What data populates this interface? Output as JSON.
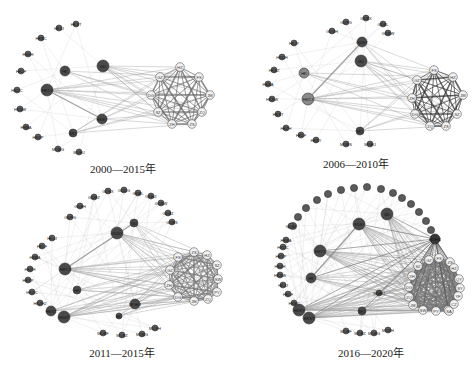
{
  "figure": {
    "panels": [
      {
        "id": "p1",
        "caption": "2000—2015年",
        "hub_left": [
          {
            "label": "HKTJ",
            "x": 47,
            "y": 90,
            "r": 6,
            "dark": true
          },
          {
            "label": "HK",
            "x": 65,
            "y": 71,
            "r": 5,
            "dark": true
          },
          {
            "label": "GD",
            "x": 103,
            "y": 66,
            "r": 6,
            "dark": true
          },
          {
            "label": "HKSY",
            "x": 102,
            "y": 119,
            "r": 5,
            "dark": true
          },
          {
            "label": "MO",
            "x": 73,
            "y": 133,
            "r": 4,
            "dark": true
          }
        ],
        "ring": [
          {
            "label": "HKST",
            "x": 76,
            "y": 24
          },
          {
            "label": "HKJJ",
            "x": 59,
            "y": 28
          },
          {
            "label": "HKBC",
            "x": 41,
            "y": 38
          },
          {
            "label": "HKZH",
            "x": 28,
            "y": 54
          },
          {
            "label": "HKLF",
            "x": 21,
            "y": 71
          },
          {
            "label": "HKDC",
            "x": 17,
            "y": 90
          },
          {
            "label": "HKSW",
            "x": 20,
            "y": 109
          },
          {
            "label": "HKBA",
            "x": 26,
            "y": 127
          },
          {
            "label": "HKYP",
            "x": 38,
            "y": 137
          },
          {
            "label": "MOBG",
            "x": 58,
            "y": 149
          },
          {
            "label": "MOHJ",
            "x": 79,
            "y": 152
          }
        ],
        "cluster": [
          {
            "label": "HZ",
            "x": 180,
            "y": 67
          },
          {
            "label": "FS",
            "x": 199,
            "y": 77
          },
          {
            "label": "JM",
            "x": 210,
            "y": 95
          },
          {
            "label": "ZQ",
            "x": 202,
            "y": 112
          },
          {
            "label": "ZS",
            "x": 192,
            "y": 124
          },
          {
            "label": "ZH",
            "x": 172,
            "y": 124
          },
          {
            "label": "SZ",
            "x": 158,
            "y": 112
          },
          {
            "label": "DG",
            "x": 151,
            "y": 95
          },
          {
            "label": "GZ",
            "x": 160,
            "y": 77
          }
        ]
      },
      {
        "id": "p2",
        "caption": "2006—2010年",
        "hub_left": [
          {
            "label": "HKTJ",
            "x": 70,
            "y": 99,
            "r": 6,
            "dark": false
          },
          {
            "label": "HK",
            "x": 66,
            "y": 73,
            "r": 5,
            "dark": false
          },
          {
            "label": "GD",
            "x": 123,
            "y": 61,
            "r": 6,
            "dark": true
          },
          {
            "label": "GDSY",
            "x": 124,
            "y": 42,
            "r": 5,
            "dark": true
          },
          {
            "label": "MO",
            "x": 122,
            "y": 131,
            "r": 4,
            "dark": true
          }
        ],
        "ring": [
          {
            "label": "GDSH",
            "x": 94,
            "y": 31
          },
          {
            "label": "GDFG",
            "x": 108,
            "y": 22
          },
          {
            "label": "GDSX",
            "x": 128,
            "y": 18
          },
          {
            "label": "GDBL",
            "x": 145,
            "y": 24
          },
          {
            "label": "GDSW",
            "x": 150,
            "y": 33
          },
          {
            "label": "HKJY",
            "x": 56,
            "y": 43
          },
          {
            "label": "HKDH",
            "x": 44,
            "y": 57
          },
          {
            "label": "HKSZ",
            "x": 36,
            "y": 70
          },
          {
            "label": "HKBA",
            "x": 30,
            "y": 84
          },
          {
            "label": "HKSW",
            "x": 34,
            "y": 99
          },
          {
            "label": "HKST",
            "x": 40,
            "y": 114
          },
          {
            "label": "HKZH",
            "x": 48,
            "y": 128
          },
          {
            "label": "HKLF",
            "x": 63,
            "y": 135
          },
          {
            "label": "HKSY",
            "x": 78,
            "y": 140
          },
          {
            "label": "MOBS",
            "x": 108,
            "y": 144
          },
          {
            "label": "MOHJ",
            "x": 132,
            "y": 144
          }
        ],
        "cluster": [
          {
            "label": "FS",
            "x": 196,
            "y": 70
          },
          {
            "label": "HZ",
            "x": 215,
            "y": 77
          },
          {
            "label": "JM",
            "x": 225,
            "y": 95
          },
          {
            "label": "SZ",
            "x": 219,
            "y": 114
          },
          {
            "label": "ZS",
            "x": 208,
            "y": 126
          },
          {
            "label": "ZQ",
            "x": 192,
            "y": 126
          },
          {
            "label": "DG",
            "x": 177,
            "y": 114
          },
          {
            "label": "ZH",
            "x": 174,
            "y": 98
          },
          {
            "label": "GZ",
            "x": 179,
            "y": 80
          }
        ]
      },
      {
        "id": "p3",
        "caption": "2011—2015年",
        "hub_left": [
          {
            "label": "HKTJ",
            "x": 65,
            "y": 89,
            "r": 6,
            "dark": true
          },
          {
            "label": "HK",
            "x": 77,
            "y": 110,
            "r": 4,
            "dark": true
          },
          {
            "label": "GDSY",
            "x": 117,
            "y": 53,
            "r": 6,
            "dark": true
          },
          {
            "label": "GD",
            "x": 134,
            "y": 43,
            "r": 4,
            "dark": true
          },
          {
            "label": "HKSY",
            "x": 64,
            "y": 137,
            "r": 6,
            "dark": true
          },
          {
            "label": "HKST",
            "x": 51,
            "y": 131,
            "r": 5,
            "dark": true
          },
          {
            "label": "MOHJ",
            "x": 135,
            "y": 124,
            "r": 5,
            "dark": true
          },
          {
            "label": "MO",
            "x": 119,
            "y": 136,
            "r": 3,
            "dark": true
          }
        ],
        "ring": [
          {
            "label": "GDFG",
            "x": 70,
            "y": 37
          },
          {
            "label": "GDSH",
            "x": 80,
            "y": 26
          },
          {
            "label": "GDMZ",
            "x": 94,
            "y": 17
          },
          {
            "label": "GDSX",
            "x": 108,
            "y": 11
          },
          {
            "label": "GDDG",
            "x": 124,
            "y": 10
          },
          {
            "label": "GDBL",
            "x": 138,
            "y": 13
          },
          {
            "label": "GDHZ",
            "x": 151,
            "y": 16
          },
          {
            "label": "GDSW",
            "x": 161,
            "y": 23
          },
          {
            "label": "GDBZ",
            "x": 168,
            "y": 33
          },
          {
            "label": "GDBS",
            "x": 172,
            "y": 42
          },
          {
            "label": "HKJJ",
            "x": 52,
            "y": 58
          },
          {
            "label": "HKLF",
            "x": 42,
            "y": 66
          },
          {
            "label": "HKBA",
            "x": 35,
            "y": 77
          },
          {
            "label": "HKZH",
            "x": 30,
            "y": 89
          },
          {
            "label": "HKYP",
            "x": 28,
            "y": 100
          },
          {
            "label": "HKDC",
            "x": 32,
            "y": 112
          },
          {
            "label": "HKZH2",
            "x": 40,
            "y": 123
          },
          {
            "label": "MOBF",
            "x": 103,
            "y": 153
          },
          {
            "label": "MOBZ",
            "x": 122,
            "y": 155
          },
          {
            "label": "MOBG",
            "x": 142,
            "y": 154
          },
          {
            "label": "MOSH",
            "x": 155,
            "y": 148
          }
        ],
        "cluster": [
          {
            "label": "ZS",
            "x": 194,
            "y": 72
          },
          {
            "label": "HZ",
            "x": 207,
            "y": 75
          },
          {
            "label": "SZ",
            "x": 217,
            "y": 85
          },
          {
            "label": "SW",
            "x": 218,
            "y": 99
          },
          {
            "label": "PY",
            "x": 217,
            "y": 112
          },
          {
            "label": "ZQ",
            "x": 208,
            "y": 119
          },
          {
            "label": "JM",
            "x": 194,
            "y": 121
          },
          {
            "label": "DG",
            "x": 178,
            "y": 117
          },
          {
            "label": "ZH",
            "x": 169,
            "y": 105
          },
          {
            "label": "GZ",
            "x": 170,
            "y": 90
          },
          {
            "label": "FS",
            "x": 178,
            "y": 77
          }
        ]
      },
      {
        "id": "p4",
        "caption": "2016—2020年",
        "hub_left": [
          {
            "label": "GDSY",
            "x": 121,
            "y": 44,
            "r": 6,
            "dark": true
          },
          {
            "label": "GD",
            "x": 149,
            "y": 34,
            "r": 6,
            "dark": true
          },
          {
            "label": "HKTJ",
            "x": 82,
            "y": 71,
            "r": 6,
            "dark": true
          },
          {
            "label": "HK",
            "x": 73,
            "y": 98,
            "r": 5,
            "dark": true
          },
          {
            "label": "HKSY",
            "x": 61,
            "y": 130,
            "r": 6,
            "dark": true
          },
          {
            "label": "HKST",
            "x": 71,
            "y": 138,
            "r": 6,
            "dark": true
          },
          {
            "label": "MOHJ",
            "x": 141,
            "y": 113,
            "r": 3,
            "dark": true
          },
          {
            "label": "MO",
            "x": 124,
            "y": 131,
            "r": 4,
            "dark": true
          }
        ],
        "ring": [
          {
            "label": "",
            "x": 55,
            "y": 46
          },
          {
            "label": "",
            "x": 60,
            "y": 37
          },
          {
            "label": "",
            "x": 68,
            "y": 28
          },
          {
            "label": "",
            "x": 79,
            "y": 20
          },
          {
            "label": "",
            "x": 90,
            "y": 14
          },
          {
            "label": "",
            "x": 103,
            "y": 10
          },
          {
            "label": "",
            "x": 116,
            "y": 8
          },
          {
            "label": "",
            "x": 129,
            "y": 7
          },
          {
            "label": "",
            "x": 143,
            "y": 9
          },
          {
            "label": "",
            "x": 155,
            "y": 13
          },
          {
            "label": "",
            "x": 164,
            "y": 18
          },
          {
            "label": "",
            "x": 173,
            "y": 24
          },
          {
            "label": "",
            "x": 181,
            "y": 32
          },
          {
            "label": "",
            "x": 188,
            "y": 41
          },
          {
            "label": "",
            "x": 193,
            "y": 50
          },
          {
            "label": "GDBS",
            "x": 197,
            "y": 59
          },
          {
            "label": "GDBZ",
            "x": 53,
            "y": 46
          },
          {
            "label": "HKBA",
            "x": 48,
            "y": 60
          },
          {
            "label": "HKDC",
            "x": 45,
            "y": 67
          },
          {
            "label": "HKYP",
            "x": 43,
            "y": 76
          },
          {
            "label": "HKZH",
            "x": 42,
            "y": 86
          },
          {
            "label": "HKSW",
            "x": 42,
            "y": 95
          },
          {
            "label": "HKJJ",
            "x": 45,
            "y": 105
          },
          {
            "label": "HKLF",
            "x": 50,
            "y": 114
          },
          {
            "label": "HKBC",
            "x": 56,
            "y": 123
          },
          {
            "label": "MOBF",
            "x": 108,
            "y": 151
          },
          {
            "label": "MOBZ",
            "x": 122,
            "y": 153
          },
          {
            "label": "MOBG",
            "x": 136,
            "y": 153
          },
          {
            "label": "MOSH",
            "x": 150,
            "y": 150
          }
        ],
        "cluster": [
          {
            "label": "GZ",
            "x": 191,
            "y": 80
          },
          {
            "label": "FS",
            "x": 201,
            "y": 78
          },
          {
            "label": "ZS",
            "x": 212,
            "y": 82
          },
          {
            "label": "HZ",
            "x": 216,
            "y": 88
          },
          {
            "label": "SZ",
            "x": 180,
            "y": 86
          },
          {
            "label": "ZH",
            "x": 174,
            "y": 96
          },
          {
            "label": "DG",
            "x": 171,
            "y": 107
          },
          {
            "label": "ZQ",
            "x": 171,
            "y": 117
          },
          {
            "label": "JM",
            "x": 175,
            "y": 125
          },
          {
            "label": "SW",
            "x": 185,
            "y": 130
          },
          {
            "label": "PY",
            "x": 198,
            "y": 131
          },
          {
            "label": "ZJ",
            "x": 210,
            "y": 130
          },
          {
            "label": "QY",
            "x": 221,
            "y": 99
          },
          {
            "label": "SY",
            "x": 222,
            "y": 108
          },
          {
            "label": "YF",
            "x": 220,
            "y": 116
          },
          {
            "label": "CZ",
            "x": 216,
            "y": 124
          },
          {
            "label": "SA",
            "x": 211,
            "y": 131
          }
        ],
        "hub_node": {
          "label": "GDHZ",
          "x": 197,
          "y": 59
        }
      }
    ]
  }
}
